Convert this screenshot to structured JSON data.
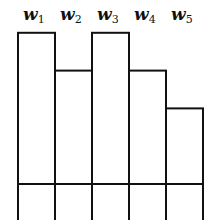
{
  "chart_data": {
    "type": "bar",
    "title": "",
    "categories": [
      "w1",
      "w2",
      "w3",
      "w4",
      "w5"
    ],
    "labels": [
      {
        "base": "w",
        "sub": "1"
      },
      {
        "base": "w",
        "sub": "2"
      },
      {
        "base": "w",
        "sub": "3"
      },
      {
        "base": "w",
        "sub": "4"
      },
      {
        "base": "w",
        "sub": "5"
      }
    ],
    "values": [
      4,
      3,
      4,
      3,
      2
    ],
    "reference_line": 0,
    "bars_extend_below_reference": true,
    "xlabel": "",
    "ylabel": "",
    "grid": false,
    "legend": "none",
    "stroke_color": "#111111",
    "fill_color": "#ffffff"
  }
}
